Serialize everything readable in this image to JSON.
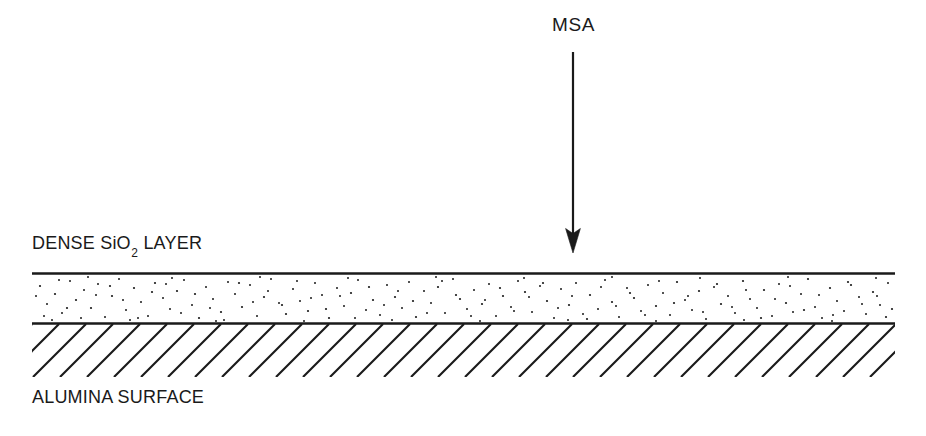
{
  "figure": {
    "width": 926,
    "height": 436,
    "background_color": "#ffffff",
    "ink_color": "#1a1a1a",
    "type": "cross-section-schematic"
  },
  "labels": {
    "beam": "MSA",
    "layer_top": "DENSE SiO",
    "layer_top_subscript": "2",
    "layer_top_suffix": " LAYER",
    "substrate": "ALUMINA SURFACE"
  },
  "arrow": {
    "name": "msa-beam-arrow",
    "direction": "down",
    "shaft_x": 573,
    "tail_y": 52,
    "tip_y": 253,
    "head_width": 15,
    "head_length": 25,
    "shaft_width": 2.2
  },
  "sio2_layer": {
    "x_start": 32,
    "x_end": 895,
    "top_y": 273.5,
    "bottom_y": 323.5,
    "thickness": 50,
    "line_width": 2.6,
    "fill": "stipple",
    "stipple_dot_count": 560,
    "stipple_dot_radius": 1.05
  },
  "alumina_hatching": {
    "x_start": 32,
    "x_end": 895,
    "top_y": 324,
    "bottom_y": 377,
    "angle_degrees": 45,
    "spacing": 27,
    "line_width": 2.1,
    "direction": "lower-left-to-upper-right"
  }
}
